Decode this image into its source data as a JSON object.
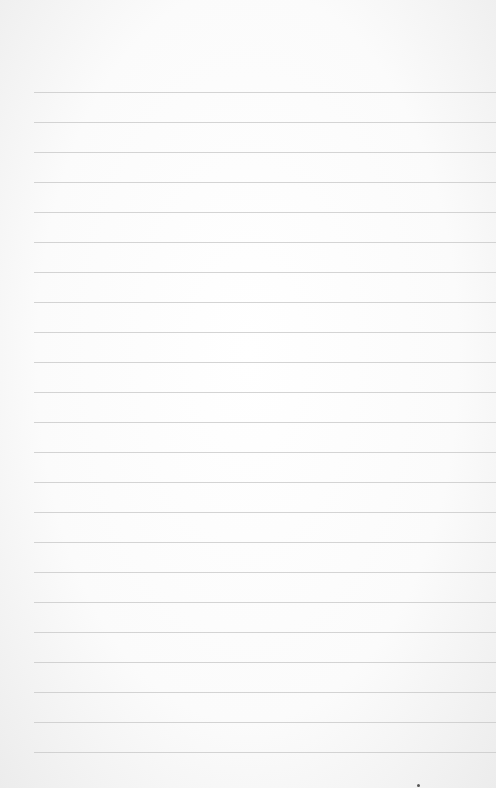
{
  "paper": {
    "type": "lined notebook paper",
    "line_count": 23,
    "first_line_y": 92,
    "line_spacing": 30,
    "line_left_x": 34,
    "line_color": "#c9c9c9",
    "background_color": "#ffffff"
  }
}
